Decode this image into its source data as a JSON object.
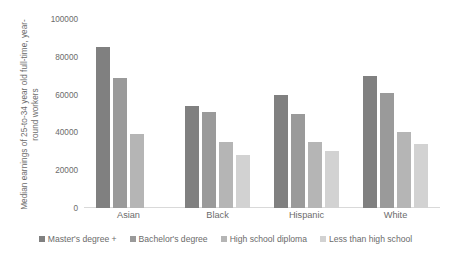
{
  "chart_data": {
    "type": "bar",
    "title": "",
    "subtitle": "",
    "xlabel": "",
    "ylabel": "Median earnings of 25-to-34 year old full-time, year-round workers",
    "ylim": [
      0,
      100000
    ],
    "yticks": [
      0,
      20000,
      40000,
      60000,
      80000,
      100000
    ],
    "ytick_labels": [
      "0",
      "20000",
      "40000",
      "60000",
      "80000",
      "100000"
    ],
    "grid": false,
    "legend_position": "bottom",
    "categories": [
      "Asian",
      "Black",
      "Hispanic",
      "White"
    ],
    "series": [
      {
        "name": "Master's degree +",
        "color": "#808080",
        "values": [
          85000,
          54000,
          60000,
          70000
        ]
      },
      {
        "name": "Bachelor's degree",
        "color": "#9a9a9a",
        "values": [
          69000,
          51000,
          50000,
          61000
        ]
      },
      {
        "name": "High school diploma",
        "color": "#b5b5b5",
        "values": [
          39000,
          35000,
          35000,
          40000
        ]
      },
      {
        "name": "Less than high school",
        "color": "#d2d2d2",
        "values": [
          null,
          28000,
          30000,
          34000
        ]
      }
    ]
  },
  "axis": {
    "y_title": "Median earnings of 25-to-34 year old full-time, year-round workers"
  },
  "colors": {
    "axis_line": "#d9d9d9",
    "tick_text": "#6b6b6b",
    "background": "#ffffff"
  }
}
